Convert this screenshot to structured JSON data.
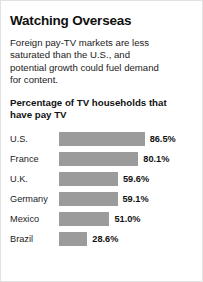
{
  "headline": "Watching Overseas",
  "deck": "Foreign pay-TV markets are less saturated than the U.S., and potential growth could fuel demand for content.",
  "chart_data": {
    "type": "bar",
    "title": "Percentage of TV households that have pay TV",
    "xlabel": "",
    "ylabel": "",
    "orientation": "horizontal",
    "grid": false,
    "legend": false,
    "xlim": [
      0,
      100
    ],
    "unit": "%",
    "bar_color": "#9b9b9b",
    "categories": [
      "U.S.",
      "France",
      "U.K.",
      "Germany",
      "Mexico",
      "Brazil"
    ],
    "values": [
      86.5,
      80.1,
      59.6,
      59.1,
      51.0,
      28.6
    ],
    "value_labels": [
      "86.5%",
      "80.1%",
      "59.6%",
      "59.1%",
      "51.0%",
      "28.6%"
    ]
  }
}
